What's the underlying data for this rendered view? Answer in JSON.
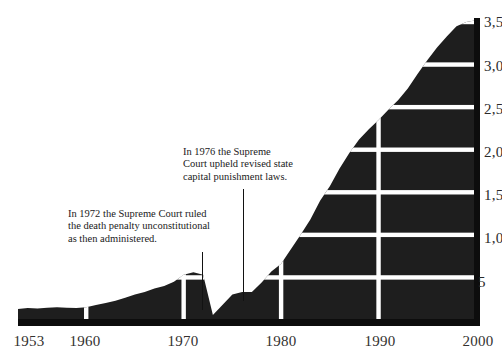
{
  "chart_data": {
    "type": "area",
    "title": "",
    "subtitle": "",
    "xlabel": "",
    "ylabel": "",
    "grid": true,
    "legend": null,
    "xlim": [
      1953,
      2000
    ],
    "ylim": [
      0,
      3500
    ],
    "xticks": [
      1953,
      1960,
      1970,
      1980,
      1990,
      2000
    ],
    "xtick_labels": [
      "1953",
      "1960",
      "1970",
      "1980",
      "1990",
      "2000"
    ],
    "yticks": [
      500,
      1000,
      1500,
      2000,
      2500,
      3000,
      3500
    ],
    "ytick_labels": [
      "5",
      "1,0",
      "1,5",
      "2,0",
      "2,5",
      "3,0",
      "3,5"
    ],
    "ytick_labels_note": "labels are clipped by the right edge of the image",
    "series_name": "Death row population",
    "x": [
      1953,
      1954,
      1955,
      1956,
      1957,
      1958,
      1959,
      1960,
      1961,
      1962,
      1963,
      1964,
      1965,
      1966,
      1967,
      1968,
      1969,
      1970,
      1971,
      1972,
      1973,
      1974,
      1975,
      1976,
      1977,
      1978,
      1979,
      1980,
      1981,
      1982,
      1983,
      1984,
      1985,
      1986,
      1987,
      1988,
      1989,
      1990,
      1991,
      1992,
      1993,
      1994,
      1995,
      1996,
      1997,
      1998,
      1999,
      2000
    ],
    "values": [
      130,
      140,
      135,
      145,
      150,
      145,
      140,
      150,
      175,
      200,
      225,
      260,
      300,
      330,
      370,
      400,
      450,
      530,
      560,
      530,
      60,
      180,
      300,
      330,
      330,
      440,
      570,
      660,
      830,
      1000,
      1180,
      1400,
      1570,
      1780,
      1960,
      2120,
      2240,
      2350,
      2470,
      2580,
      2720,
      2890,
      3050,
      3200,
      3330,
      3450,
      3500,
      3520
    ],
    "annotations": [
      {
        "id": "ann-1972",
        "text": "In 1972 the Supreme Court ruled\nthe death penalty unconstitutional\nas then administered.",
        "points_to_year": 1972
      },
      {
        "id": "ann-1976",
        "text": "In 1976 the Supreme\nCourt upheld revised state\ncapital punishment laws.",
        "points_to_year": 1976
      }
    ],
    "colors": {
      "background": "#ffffff",
      "area_fill": "#1e1e1e",
      "gridline": "#ffffff",
      "axis_rule": "#0d0d0d",
      "text": "#2a2a2a"
    }
  },
  "axis": {
    "x_labels": [
      {
        "text": "1953",
        "x": 29
      },
      {
        "text": "1960",
        "x": 85
      },
      {
        "text": "1970",
        "x": 183
      },
      {
        "text": "1980",
        "x": 281
      },
      {
        "text": "1990",
        "x": 380
      },
      {
        "text": "2000",
        "x": 478
      }
    ],
    "y_labels": [
      {
        "text": "3,5",
        "y": 14
      },
      {
        "text": "3,0",
        "y": 58
      },
      {
        "text": "2,5",
        "y": 101
      },
      {
        "text": "2,0",
        "y": 144
      },
      {
        "text": "1,5",
        "y": 187
      },
      {
        "text": "1,0",
        "y": 230
      },
      {
        "text": "5",
        "y": 274
      }
    ]
  },
  "annotations": {
    "ann_1972": "In 1972 the Supreme Court ruled\nthe death penalty unconstitutional\nas then administered.",
    "ann_1976": "In 1976 the Supreme\nCourt upheld revised state\ncapital punishment laws."
  }
}
